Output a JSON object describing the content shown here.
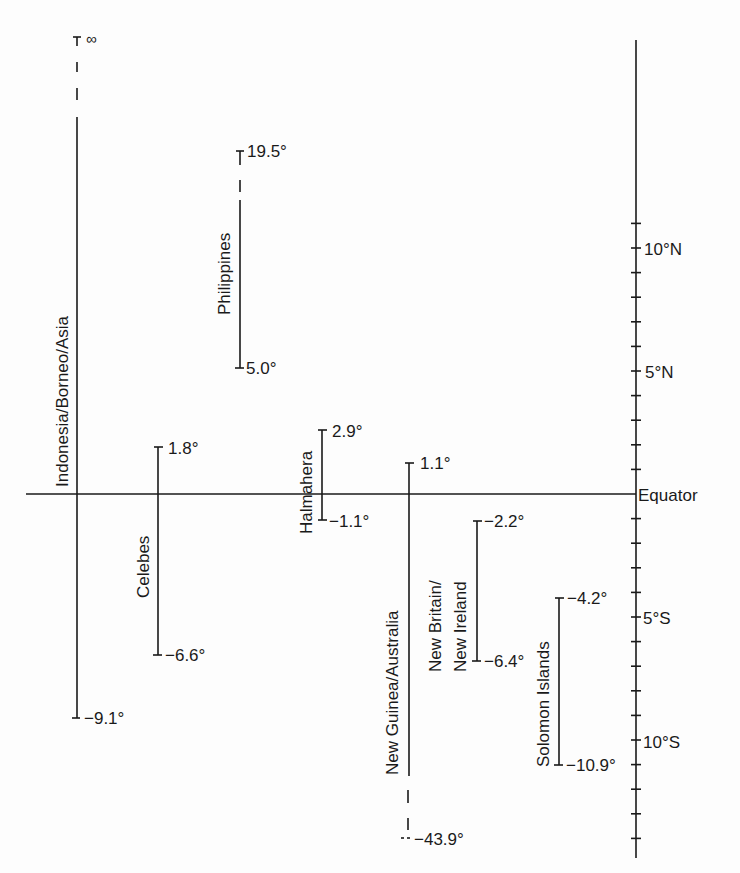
{
  "diagram": {
    "type": "latitude-range-diagram",
    "equator_label": "Equator",
    "infinity_label": "∞",
    "scale": {
      "labels": [
        {
          "text": "10°N",
          "lat": 10
        },
        {
          "text": "5°N",
          "lat": 5
        },
        {
          "text": "5°S",
          "lat": -5
        },
        {
          "text": "10°S",
          "lat": -10
        }
      ],
      "tick_every_degrees": 1,
      "range": [
        14.5,
        -14.9
      ]
    },
    "ranges": [
      {
        "name": "Indonesia/Borneo/Asia",
        "top_label": "∞",
        "bottom_label": "−9.1°",
        "top": "infinity",
        "bottom": -9.1
      },
      {
        "name": "Philippines",
        "top_label": "19.5°",
        "bottom_label": "5.0°",
        "top": 19.5,
        "bottom": 5.0
      },
      {
        "name": "Celebes",
        "top_label": "1.8°",
        "bottom_label": "−6.6°",
        "top": 1.8,
        "bottom": -6.6
      },
      {
        "name": "Halmahera",
        "top_label": "2.9°",
        "bottom_label": "−1.1°",
        "top": 2.9,
        "bottom": -1.1
      },
      {
        "name": "New Guinea/Australia",
        "top_label": "1.1°",
        "bottom_label": "−43.9°",
        "top": 1.1,
        "bottom": -43.9
      },
      {
        "name": "New Britain/ New Ireland",
        "name_line1": "New Britain/",
        "name_line2": "New Ireland",
        "top_label": "−2.2°",
        "bottom_label": "−6.4°",
        "top": -2.2,
        "bottom": -6.4
      },
      {
        "name": "Solomon Islands",
        "top_label": "−4.2°",
        "bottom_label": "−10.9°",
        "top": -4.2,
        "bottom": -10.9
      }
    ]
  }
}
